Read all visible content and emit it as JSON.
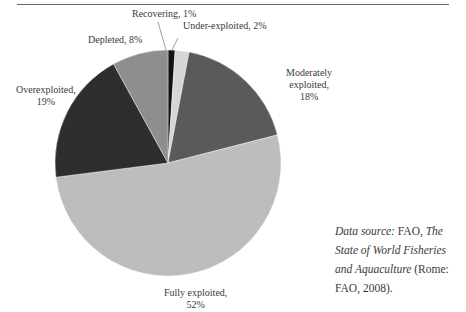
{
  "chart_data": {
    "type": "pie",
    "title": "",
    "start_angle_deg": 0,
    "direction": "clockwise",
    "slices": [
      {
        "label": "Recovering",
        "value": 1,
        "text": "Recovering, 1%",
        "color": "#111111"
      },
      {
        "label": "Under-exploited",
        "value": 2,
        "text": "Under-exploited, 2%",
        "color": "#d6d6d6"
      },
      {
        "label": "Moderately exploited",
        "value": 18,
        "text": "Moderately exploited, 18%",
        "color": "#5a5a5a"
      },
      {
        "label": "Fully exploited",
        "value": 52,
        "text": "Fully exploited, 52%",
        "color": "#bdbdbd"
      },
      {
        "label": "Overexploited",
        "value": 19,
        "text": "Overexploited, 19%",
        "color": "#2e2e2e"
      },
      {
        "label": "Depleted",
        "value": 8,
        "text": "Depleted, 8%",
        "color": "#8e8e8e"
      }
    ],
    "legend": "none (direct labels)"
  },
  "labels": {
    "recovering": "Recovering, 1%",
    "under": "Under-exploited, 2%",
    "moderately_l1": "Moderately",
    "moderately_l2": "exploited,",
    "moderately_l3": "18%",
    "over_l1": "Overexploited,",
    "over_l2": "19%",
    "depleted": "Depleted, 8%",
    "fully_l1": "Fully exploited,",
    "fully_l2": "52%"
  },
  "source": {
    "prefix": "Data source:",
    "org": " FAO, ",
    "title": "The State of World Fisheries and Aquaculture",
    "suffix": " (Rome: FAO, 2008)."
  }
}
